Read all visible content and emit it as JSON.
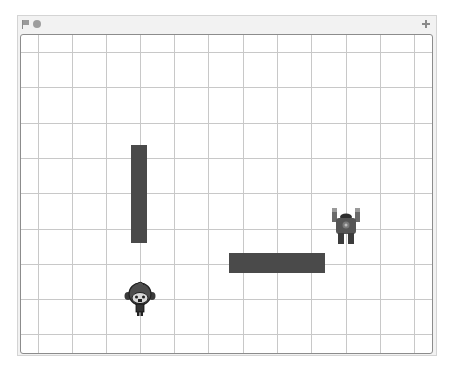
{
  "window": {
    "header": {
      "green_flag_icon": "green-flag-icon",
      "stop_icon": "stop-sign-icon",
      "fullscreen_icon": "fullscreen-toggle-icon"
    }
  },
  "stage": {
    "grid": {
      "vertical_lines_x": [
        38,
        72,
        106,
        140,
        174,
        208,
        243,
        277,
        311,
        346,
        380,
        414
      ],
      "horizontal_lines_y": [
        52,
        87,
        123,
        158,
        193,
        229,
        264,
        299,
        334
      ]
    },
    "walls": [
      {
        "name": "vertical-wall",
        "x": 131,
        "y": 145,
        "width": 16,
        "height": 98
      },
      {
        "name": "horizontal-wall",
        "x": 229,
        "y": 253,
        "width": 96,
        "height": 20
      }
    ],
    "sprites": [
      {
        "name": "monkey-sprite",
        "x": 124,
        "y": 281,
        "width": 32,
        "height": 36
      },
      {
        "name": "robot-sprite",
        "x": 331,
        "y": 208,
        "width": 30,
        "height": 37
      }
    ],
    "colors": {
      "wall": "#4a4a4a",
      "grid": "#c8c8c8",
      "stage_border": "#8c8c8c",
      "header_bg": "#f2f2f2"
    }
  }
}
